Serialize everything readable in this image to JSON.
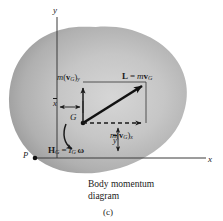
{
  "figure": {
    "label": "(c)",
    "caption_line1": "Body momentum",
    "caption_line2": "diagram",
    "colors": {
      "blob_light": "#cdcdcd",
      "blob_mid": "#b4b4b4",
      "blob_dark": "#8f8f8f",
      "ink": "#1a1a1a",
      "axis": "#3a3a3a"
    }
  },
  "axes": {
    "y_label": "y",
    "x_label": "x",
    "origin_label": "P"
  },
  "points": {
    "center_of_mass": "G"
  },
  "dimensions": {
    "x_bar": "x",
    "y_bar": "y",
    "x_bar_full": "x̄",
    "y_bar_full": "ȳ"
  },
  "vectors": {
    "momentum_y": {
      "m": "m",
      "open": "(",
      "v": "v",
      "sub": "G",
      "close": ")",
      "comp": "y"
    },
    "momentum_x": {
      "m": "m",
      "open": "(",
      "v": "v",
      "sub": "G",
      "close": ")",
      "comp": "x"
    },
    "linear_momentum": {
      "L": "L",
      "eq": "=",
      "m": "m",
      "v": "v",
      "sub": "G"
    },
    "angular_momentum": {
      "H": "H",
      "sub1": "G",
      "eq": "=",
      "I": "I",
      "sub2": "G",
      "omega": "ω"
    }
  }
}
